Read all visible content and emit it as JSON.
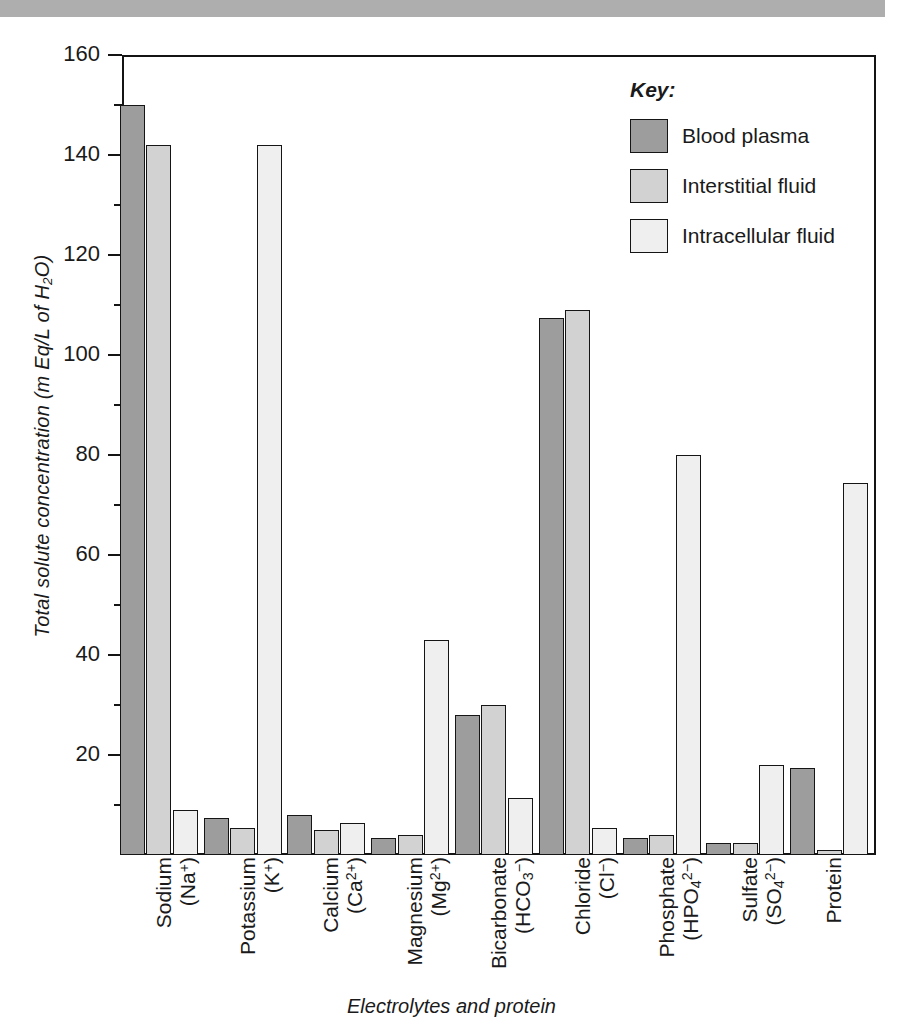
{
  "figure": {
    "banner_color": "#aeaeae",
    "axis_color": "#141414"
  },
  "chart_data": {
    "type": "bar",
    "title": "",
    "xlabel": "Electrolytes and protein",
    "ylabel": "Total solute concentration (m Eq/L of H₂O)",
    "ylim": [
      0,
      160
    ],
    "ytick_major": [
      0,
      20,
      40,
      60,
      80,
      100,
      120,
      140,
      160
    ],
    "ytick_minor": [
      10,
      30,
      50,
      70,
      90,
      110,
      130,
      150
    ],
    "ytick_labels": [
      "0",
      "20",
      "40",
      "60",
      "80",
      "100",
      "120",
      "140",
      "160"
    ],
    "grid": false,
    "legend_position": "top-right",
    "categories": [
      "Sodium (Na+)",
      "Potassium (K+)",
      "Calcium (Ca2+)",
      "Magnesium (Mg2+)",
      "Bicarbonate (HCO3-)",
      "Chloride (Cl-)",
      "Phosphate (HPO42-)",
      "Sulfate (SO42-)",
      "Protein"
    ],
    "category_labels": [
      {
        "name": "Sodium",
        "formula_pre": "(Na",
        "formula_sub": "",
        "formula_sup": "+",
        "formula_post": ")"
      },
      {
        "name": "Potassium",
        "formula_pre": "(K",
        "formula_sub": "",
        "formula_sup": "+",
        "formula_post": ")"
      },
      {
        "name": "Calcium",
        "formula_pre": "(Ca",
        "formula_sub": "",
        "formula_sup": "2+",
        "formula_post": ")"
      },
      {
        "name": "Magnesium",
        "formula_pre": "(Mg",
        "formula_sub": "",
        "formula_sup": "2+",
        "formula_post": ")"
      },
      {
        "name": "Bicarbonate",
        "formula_pre": "(HCO",
        "formula_sub": "3",
        "formula_sup": "−",
        "formula_post": ")"
      },
      {
        "name": "Chloride",
        "formula_pre": "(Cl",
        "formula_sub": "",
        "formula_sup": "−",
        "formula_post": ")"
      },
      {
        "name": "Phosphate",
        "formula_pre": "(HPO",
        "formula_sub": "4",
        "formula_sup": "2−",
        "formula_post": ")"
      },
      {
        "name": "Sulfate",
        "formula_pre": "(SO",
        "formula_sub": "4",
        "formula_sup": "2−",
        "formula_post": ")"
      },
      {
        "name": "Protein",
        "formula_pre": "",
        "formula_sub": "",
        "formula_sup": "",
        "formula_post": ""
      }
    ],
    "series": [
      {
        "name": "Blood plasma",
        "color": "#9d9d9d",
        "values": [
          150,
          7.5,
          8,
          3.5,
          28,
          107.5,
          3.5,
          2.5,
          17.5
        ]
      },
      {
        "name": "Interstitial fluid",
        "color": "#d2d2d2",
        "values": [
          142,
          5.5,
          5,
          4,
          30,
          109,
          4,
          2.5,
          1
        ]
      },
      {
        "name": "Intracellular fluid",
        "color": "#efefef",
        "values": [
          9,
          142,
          6.5,
          43,
          11.5,
          5.5,
          80,
          18,
          74.5
        ]
      }
    ]
  },
  "legend": {
    "title": "Key:",
    "entries": [
      {
        "label": "Blood plasma",
        "color": "#9d9d9d"
      },
      {
        "label": "Interstitial fluid",
        "color": "#d2d2d2"
      },
      {
        "label": "Intracellular fluid",
        "color": "#efefef"
      }
    ]
  }
}
